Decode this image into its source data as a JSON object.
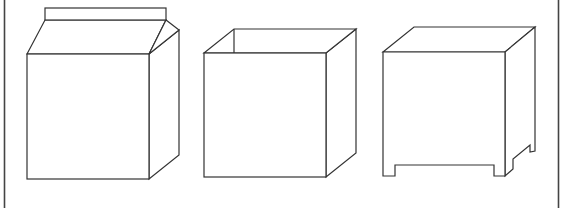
{
  "figure": {
    "stroke_color": "#333333",
    "background": "#ffffff",
    "shapes": [
      {
        "name": "milk-carton",
        "label": "carton with gabled top"
      },
      {
        "name": "open-box",
        "label": "open-top cube box"
      },
      {
        "name": "box-with-feet",
        "label": "closed cube with notched feet"
      }
    ]
  }
}
